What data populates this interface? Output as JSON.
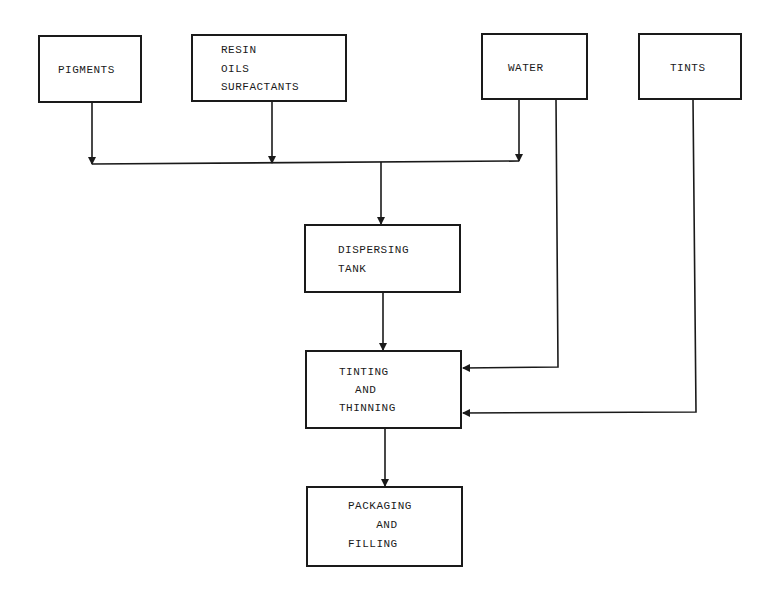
{
  "diagram": {
    "type": "process-flow",
    "nodes": [
      {
        "id": "pigments",
        "lines": [
          "PIGMENTS"
        ]
      },
      {
        "id": "resin",
        "lines": [
          "RESIN",
          "OILS",
          "SURFACTANTS"
        ]
      },
      {
        "id": "water",
        "lines": [
          "WATER"
        ]
      },
      {
        "id": "tints",
        "lines": [
          "TINTS"
        ]
      },
      {
        "id": "dispersing",
        "lines": [
          "DISPERSING",
          "TANK"
        ]
      },
      {
        "id": "tinting",
        "lines": [
          "TINTING",
          " AND",
          "THINNING"
        ]
      },
      {
        "id": "packaging",
        "lines": [
          "PACKAGING",
          "  AND",
          "FILLING"
        ]
      }
    ],
    "edges": [
      {
        "from": "pigments",
        "to": "dispersing"
      },
      {
        "from": "resin",
        "to": "dispersing"
      },
      {
        "from": "water",
        "to": "dispersing"
      },
      {
        "from": "water",
        "to": "tinting"
      },
      {
        "from": "tints",
        "to": "tinting"
      },
      {
        "from": "dispersing",
        "to": "tinting"
      },
      {
        "from": "tinting",
        "to": "packaging"
      }
    ]
  }
}
